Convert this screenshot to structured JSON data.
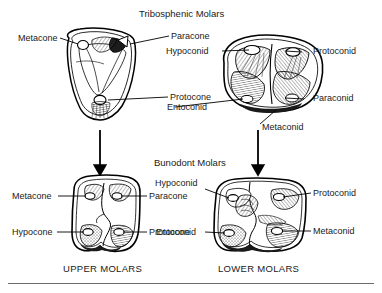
{
  "figure": {
    "title_top": "Tribosphenic Molars",
    "title_middle": "Bunodont Molars",
    "caption_left": "UPPER MOLARS",
    "caption_right": "LOWER MOLARS",
    "ink_color": "#000000",
    "rule_color": "#6b6b6b",
    "background": "#ffffff"
  },
  "tribosphenic_upper": {
    "name": "tribosphenic-upper-molar",
    "labels": {
      "metacone": "Metacone",
      "paracone": "Paracone",
      "protocone": "Protocone"
    }
  },
  "tribosphenic_lower": {
    "name": "tribosphenic-lower-molar",
    "labels": {
      "hypoconid": "Hypoconid",
      "protoconid": "Protoconid",
      "paraconid": "Paraconid",
      "entoconid": "Entoconid",
      "metaconid": "Metaconid"
    }
  },
  "bunodont_upper": {
    "name": "bunodont-upper-molar",
    "labels": {
      "metacone": "Metacone",
      "paracone": "Paracone",
      "hypocone": "Hypocone",
      "protocone": "Protocone"
    }
  },
  "bunodont_lower": {
    "name": "bunodont-lower-molar",
    "labels": {
      "hypoconid": "Hypoconid",
      "protoconid": "Protoconid",
      "entoconid": "Entoconid",
      "metaconid": "Metaconid"
    }
  },
  "arrows": {
    "left_arrow": "down-arrow",
    "right_arrow": "down-arrow"
  }
}
